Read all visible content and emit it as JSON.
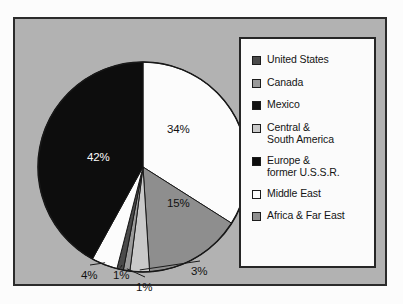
{
  "figure": {
    "panel_bg": "#b2b2b2",
    "panel_border": "#2b2b2b",
    "legend_bg": "#fbfbfb",
    "legend_border": "#262626"
  },
  "legend": {
    "items": [
      {
        "label": "United States",
        "color": "#4a4a4a",
        "swatch_name": "legend-swatch-united-states"
      },
      {
        "label": "Canada",
        "color": "#9a9a9a",
        "swatch_name": "legend-swatch-canada"
      },
      {
        "label": "Mexico",
        "color": "#111111",
        "swatch_name": "legend-swatch-mexico"
      },
      {
        "label": "Central &\nSouth America",
        "color": "#c9c9c9",
        "swatch_name": "legend-swatch-central-south-america"
      },
      {
        "label": "Europe &\nformer U.S.S.R.",
        "color": "#0d0d0d",
        "swatch_name": "legend-swatch-europe-former-ussr"
      },
      {
        "label": "Middle East",
        "color": "#fcfcfc",
        "swatch_name": "legend-swatch-middle-east"
      },
      {
        "label": "Africa & Far East",
        "color": "#8e8e8e",
        "swatch_name": "legend-swatch-africa-far-east"
      }
    ]
  },
  "chart_data": {
    "type": "pie",
    "title": "",
    "legend_position": "right",
    "start_angle_deg": 0,
    "direction": "clockwise",
    "center": {
      "x": 128,
      "y": 148
    },
    "radius": 105,
    "categories": [
      "Middle East",
      "Africa & Far East",
      "Central & South America",
      "Canada",
      "United States",
      "Mexico",
      "Europe & former U.S.S.R."
    ],
    "values": [
      34,
      15,
      3,
      1,
      1,
      4,
      42
    ],
    "colors": [
      "#fcfcfc",
      "#8e8e8e",
      "#c9c9c9",
      "#9a9a9a",
      "#4a4a4a",
      "#fcfcfc",
      "#0d0d0d"
    ],
    "slice_labels": [
      {
        "text": "34%",
        "category": "Middle East",
        "placement": "inside",
        "x": 152,
        "y": 104,
        "on_dark": false
      },
      {
        "text": "15%",
        "category": "Africa & Far East",
        "placement": "inside",
        "x": 152,
        "y": 178,
        "on_dark": false
      },
      {
        "text": "3%",
        "category": "Central & South America",
        "placement": "outside",
        "x": 176,
        "y": 246,
        "on_dark": false
      },
      {
        "text": "1%",
        "category": "Canada",
        "placement": "outside",
        "x": 121,
        "y": 262,
        "on_dark": false
      },
      {
        "text": "1%",
        "category": "United States",
        "placement": "outside",
        "x": 98,
        "y": 250,
        "on_dark": false
      },
      {
        "text": "4%",
        "category": "Mexico",
        "placement": "outside",
        "x": 66,
        "y": 250,
        "on_dark": false
      },
      {
        "text": "42%",
        "category": "Europe & former U.S.S.R.",
        "placement": "inside",
        "x": 72,
        "y": 132,
        "on_dark": true
      }
    ]
  }
}
